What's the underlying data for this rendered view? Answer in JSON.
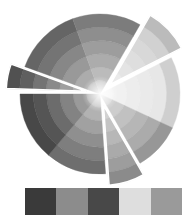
{
  "illustration": {
    "name": "color-wheel",
    "center": [
      100,
      94
    ],
    "radius": 80,
    "rings": 6,
    "segments": [
      {
        "start": -60,
        "end": -27,
        "tone": "#d0d0d0",
        "explode": 14
      },
      {
        "start": -27,
        "end": 25,
        "tone": "#e6e6e6",
        "explode": 0
      },
      {
        "start": 25,
        "end": 60,
        "tone": "#a8a8a8",
        "explode": 0
      },
      {
        "start": 60,
        "end": 86,
        "tone": "#9a9a9a",
        "explode": 12
      },
      {
        "start": 86,
        "end": 130,
        "tone": "#7a7a7a",
        "explode": 0
      },
      {
        "start": 130,
        "end": 180,
        "tone": "#505050",
        "explode": 0
      },
      {
        "start": 182,
        "end": 200,
        "tone": "#5a5a5a",
        "explode": 14
      },
      {
        "start": 200,
        "end": 250,
        "tone": "#707070",
        "explode": 0
      },
      {
        "start": 250,
        "end": 300,
        "tone": "#8a8a8a",
        "explode": 0
      }
    ]
  },
  "swatches": [
    {
      "name": "swatch-1",
      "color": "#3a3a3a"
    },
    {
      "name": "swatch-2",
      "color": "#8c8c8c"
    },
    {
      "name": "swatch-3",
      "color": "#484848"
    },
    {
      "name": "swatch-4",
      "color": "#dedede"
    },
    {
      "name": "swatch-5",
      "color": "#9a9a9a"
    }
  ]
}
